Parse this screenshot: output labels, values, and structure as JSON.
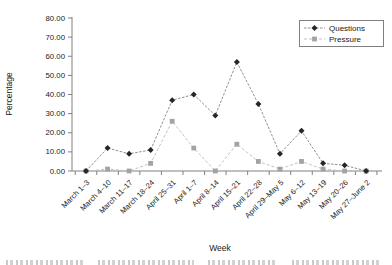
{
  "chart_data": {
    "type": "line",
    "title": "",
    "xlabel": "Week",
    "ylabel": "Percentage",
    "ylim": [
      0,
      80
    ],
    "ytick_step": 10,
    "ytick_decimals": 2,
    "grid": false,
    "legend_position": "top-right",
    "categories": [
      "March 1–3",
      "March 4–10",
      "March 11–17",
      "March 18–24",
      "April 25–31",
      "April 1–7",
      "April 8–14",
      "April 15–21",
      "April 22–28",
      "April 29–May 5",
      "May 6–12",
      "May 13–19",
      "May 20–26",
      "May 27–June 2"
    ],
    "series": [
      {
        "name": "Questions",
        "marker": "diamond",
        "marker_color": "#262626",
        "line_color": "#8f8f8f",
        "line_dash": "2.5,1.5",
        "values": [
          0,
          12,
          9,
          11,
          37,
          40,
          29,
          57,
          35,
          9,
          21,
          4,
          3,
          0
        ]
      },
      {
        "name": "Pressure",
        "marker": "square",
        "marker_color": "#a3a3a3",
        "line_color": "#c2c2c2",
        "line_dash": "3,2",
        "values": [
          0,
          1,
          0,
          4,
          26,
          12,
          0,
          14,
          5,
          1,
          5,
          1,
          0,
          0
        ]
      }
    ],
    "axis_color": "#808080",
    "text_color": "#1a1a1a"
  }
}
